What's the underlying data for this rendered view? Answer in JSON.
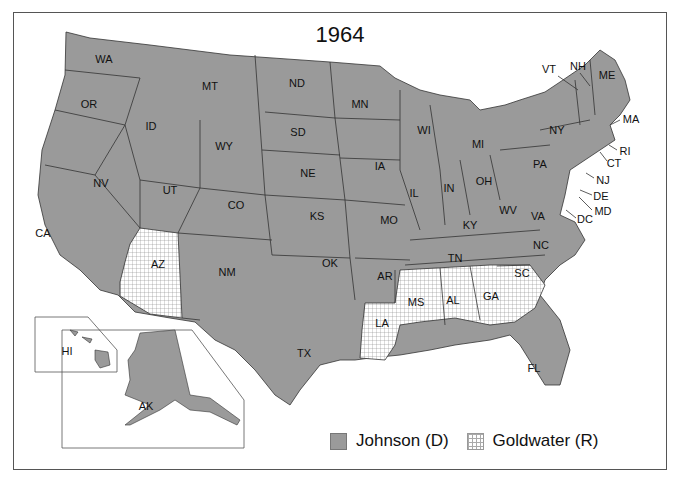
{
  "title": "1964",
  "colors": {
    "johnson": "#9a9a9a",
    "goldwater_pattern": "#ffffff",
    "border": "#333333"
  },
  "legend": [
    {
      "label": "Johnson (D)",
      "pattern": "solid-gray"
    },
    {
      "label": "Goldwater (R)",
      "pattern": "grid-hatch"
    }
  ],
  "states": {
    "johnson": [
      "WA",
      "OR",
      "CA",
      "NV",
      "ID",
      "MT",
      "WY",
      "UT",
      "CO",
      "NM",
      "ND",
      "SD",
      "NE",
      "KS",
      "OK",
      "TX",
      "MN",
      "IA",
      "MO",
      "AR",
      "WI",
      "IL",
      "MI",
      "IN",
      "OH",
      "KY",
      "TN",
      "WV",
      "VA",
      "NC",
      "PA",
      "NY",
      "VT",
      "NH",
      "ME",
      "MA",
      "RI",
      "CT",
      "NJ",
      "DE",
      "MD",
      "DC",
      "FL",
      "AK",
      "HI"
    ],
    "goldwater": [
      "AZ",
      "LA",
      "MS",
      "AL",
      "GA",
      "SC"
    ]
  },
  "labels": {
    "WA": "WA",
    "OR": "OR",
    "CA": "CA",
    "NV": "NV",
    "ID": "ID",
    "MT": "MT",
    "WY": "WY",
    "UT": "UT",
    "CO": "CO",
    "AZ": "AZ",
    "NM": "NM",
    "ND": "ND",
    "SD": "SD",
    "NE": "NE",
    "KS": "KS",
    "OK": "OK",
    "TX": "TX",
    "MN": "MN",
    "IA": "IA",
    "MO": "MO",
    "AR": "AR",
    "LA": "LA",
    "WI": "WI",
    "IL": "IL",
    "MI": "MI",
    "IN": "IN",
    "OH": "OH",
    "KY": "KY",
    "TN": "TN",
    "MS": "MS",
    "AL": "AL",
    "GA": "GA",
    "FL": "FL",
    "SC": "SC",
    "NC": "NC",
    "VA": "VA",
    "WV": "WV",
    "PA": "PA",
    "NY": "NY",
    "VT": "VT",
    "NH": "NH",
    "ME": "ME",
    "MA": "MA",
    "RI": "RI",
    "CT": "CT",
    "NJ": "NJ",
    "DE": "DE",
    "MD": "MD",
    "DC": "DC",
    "AK": "AK",
    "HI": "HI"
  }
}
